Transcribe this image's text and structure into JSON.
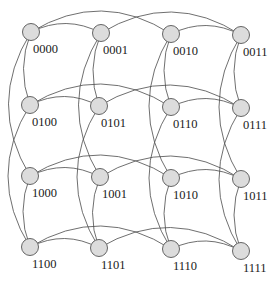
{
  "diagram": {
    "colors": {
      "node_fill": "#dcdcdc",
      "node_stroke": "#555555",
      "edge": "#4a4a4a",
      "label": "#1a1a1a"
    },
    "nodes": [
      {
        "id": "0000",
        "label": "0000",
        "x": 31,
        "y": 32
      },
      {
        "id": "0001",
        "label": "0001",
        "x": 101,
        "y": 33
      },
      {
        "id": "0010",
        "label": "0010",
        "x": 171,
        "y": 34
      },
      {
        "id": "0011",
        "label": "0011",
        "x": 241,
        "y": 35
      },
      {
        "id": "0100",
        "label": "0100",
        "x": 30,
        "y": 105
      },
      {
        "id": "0101",
        "label": "0101",
        "x": 99,
        "y": 106
      },
      {
        "id": "0110",
        "label": "0110",
        "x": 171,
        "y": 107
      },
      {
        "id": "0111",
        "label": "0111",
        "x": 241,
        "y": 108
      },
      {
        "id": "1000",
        "label": "1000",
        "x": 30,
        "y": 176
      },
      {
        "id": "1001",
        "label": "1001",
        "x": 100,
        "y": 177
      },
      {
        "id": "1010",
        "label": "1010",
        "x": 171,
        "y": 178
      },
      {
        "id": "1011",
        "label": "1011",
        "x": 241,
        "y": 179
      },
      {
        "id": "1100",
        "label": "1100",
        "x": 30,
        "y": 247
      },
      {
        "id": "1101",
        "label": "1101",
        "x": 99,
        "y": 248
      },
      {
        "id": "1110",
        "label": "1110",
        "x": 171,
        "y": 249
      },
      {
        "id": "1111",
        "label": "1111",
        "x": 241,
        "y": 251
      }
    ],
    "edges": [
      {
        "from": "0000",
        "to": "0001",
        "bend": -9
      },
      {
        "from": "0010",
        "to": "0011",
        "bend": -9
      },
      {
        "from": "0100",
        "to": "0101",
        "bend": -9
      },
      {
        "from": "0110",
        "to": "0111",
        "bend": -9
      },
      {
        "from": "1000",
        "to": "1001",
        "bend": -9
      },
      {
        "from": "1010",
        "to": "1011",
        "bend": -9
      },
      {
        "from": "1100",
        "to": "1101",
        "bend": -9
      },
      {
        "from": "1110",
        "to": "1111",
        "bend": -9
      },
      {
        "from": "0000",
        "to": "0010",
        "bend": -22
      },
      {
        "from": "0001",
        "to": "0011",
        "bend": -22
      },
      {
        "from": "0100",
        "to": "0110",
        "bend": -22
      },
      {
        "from": "0101",
        "to": "0111",
        "bend": -22
      },
      {
        "from": "1000",
        "to": "1010",
        "bend": -22
      },
      {
        "from": "1001",
        "to": "1011",
        "bend": -22
      },
      {
        "from": "1100",
        "to": "1110",
        "bend": -22
      },
      {
        "from": "1101",
        "to": "1111",
        "bend": -22
      },
      {
        "from": "0000",
        "to": "0100",
        "bend": 7
      },
      {
        "from": "0001",
        "to": "0101",
        "bend": 7
      },
      {
        "from": "0010",
        "to": "0110",
        "bend": 7
      },
      {
        "from": "0011",
        "to": "0111",
        "bend": 7
      },
      {
        "from": "1000",
        "to": "1100",
        "bend": 7
      },
      {
        "from": "1001",
        "to": "1101",
        "bend": 7
      },
      {
        "from": "1010",
        "to": "1110",
        "bend": 7
      },
      {
        "from": "1011",
        "to": "1111",
        "bend": 7
      },
      {
        "from": "0000",
        "to": "1000",
        "bend": 22
      },
      {
        "from": "0001",
        "to": "1001",
        "bend": 22
      },
      {
        "from": "0010",
        "to": "1010",
        "bend": 22
      },
      {
        "from": "0011",
        "to": "1011",
        "bend": 22
      },
      {
        "from": "0100",
        "to": "1100",
        "bend": 22
      },
      {
        "from": "0101",
        "to": "1101",
        "bend": 22
      },
      {
        "from": "0110",
        "to": "1110",
        "bend": 22
      },
      {
        "from": "0111",
        "to": "1111",
        "bend": 22
      }
    ]
  }
}
